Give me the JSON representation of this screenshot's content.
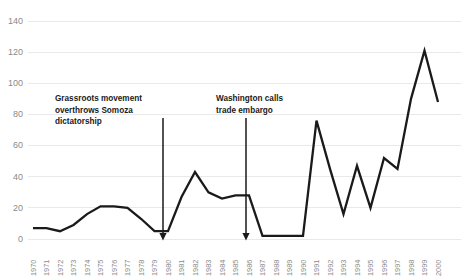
{
  "chart_data": {
    "type": "line",
    "title": "",
    "subtitle": "",
    "xlabel": "",
    "ylabel": "",
    "grid": true,
    "legend": false,
    "legend_position": "none",
    "xlim": [
      1970,
      2000
    ],
    "ylim": [
      0,
      140
    ],
    "ytick_labels": [
      "0",
      "20",
      "40",
      "60",
      "80",
      "100",
      "120",
      "140"
    ],
    "yticks": [
      0,
      20,
      40,
      60,
      80,
      100,
      120,
      140
    ],
    "categories": [
      "1970",
      "1971",
      "1972",
      "1973",
      "1974",
      "1975",
      "1976",
      "1977",
      "1978",
      "1979",
      "1980",
      "1981",
      "1982",
      "1983",
      "1984",
      "1985",
      "1986",
      "1987",
      "1988",
      "1989",
      "1990",
      "1991",
      "1992",
      "1993",
      "1994",
      "1995",
      "1996",
      "1997",
      "1998",
      "1999",
      "2000"
    ],
    "x": [
      1970,
      1971,
      1972,
      1973,
      1974,
      1975,
      1976,
      1977,
      1978,
      1979,
      1980,
      1981,
      1982,
      1983,
      1984,
      1985,
      1986,
      1987,
      1988,
      1989,
      1990,
      1991,
      1992,
      1993,
      1994,
      1995,
      1996,
      1997,
      1998,
      1999,
      2000
    ],
    "values": [
      7,
      7,
      5,
      9,
      16,
      21,
      21,
      20,
      13,
      5,
      5,
      27,
      43,
      30,
      26,
      28,
      28,
      2,
      2,
      2,
      2,
      76,
      45,
      16,
      47,
      20,
      52,
      45,
      90,
      121,
      88
    ],
    "line_color": "#1a1a1a",
    "grid_color": "#e9e9ec",
    "tick_color": "#8a8a8a",
    "annotations": [
      {
        "id": "annotation-somoza",
        "lines": [
          "Grassroots movement",
          "overthrows Somoza",
          "dictatorship"
        ],
        "target_year": 1979,
        "target_value": 5
      },
      {
        "id": "annotation-embargo",
        "lines": [
          "Washington calls",
          "trade embargo"
        ],
        "target_year": 1985,
        "target_value": 28
      }
    ]
  }
}
